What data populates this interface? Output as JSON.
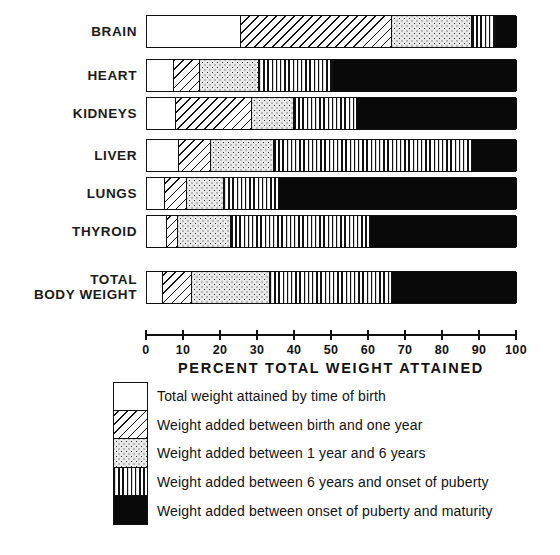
{
  "chart_data": {
    "type": "bar",
    "subtype": "stacked-horizontal-100pct",
    "title": "",
    "xlabel": "PERCENT TOTAL WEIGHT ATTAINED",
    "ylabel": "",
    "xlim": [
      0,
      100
    ],
    "grid": false,
    "legend_position": "bottom",
    "categories": [
      "BRAIN",
      "HEART",
      "KIDNEYS",
      "LIVER",
      "LUNGS",
      "THYROID",
      "TOTAL BODY WEIGHT"
    ],
    "series": [
      {
        "name": "Total weight attained by time of birth",
        "pattern": "white",
        "values": [
          25,
          7,
          7.5,
          8.5,
          4.5,
          5,
          4
        ]
      },
      {
        "name": "Weight added between birth and one year",
        "pattern": "diagonal-hatch",
        "values": [
          41,
          7,
          20.5,
          8.5,
          6,
          3,
          8
        ]
      },
      {
        "name": "Weight added between 1 year and 6 years",
        "pattern": "dots",
        "values": [
          21.5,
          16,
          11.5,
          17,
          10,
          14.5,
          21
        ]
      },
      {
        "name": "Weight added between 6 years and onset of puberty",
        "pattern": "vertical-lines",
        "values": [
          6.5,
          20,
          17,
          53.5,
          15,
          37.5,
          33
        ]
      },
      {
        "name": "Weight added between onset of puberty and maturity",
        "pattern": "solid-black",
        "values": [
          6,
          50,
          43.5,
          12.5,
          64.5,
          40,
          34
        ]
      }
    ],
    "cumulative_boundaries": {
      "BRAIN": [
        25,
        66,
        87.5,
        94,
        100
      ],
      "HEART": [
        7,
        14,
        30,
        50,
        100
      ],
      "KIDNEYS": [
        7.5,
        28,
        39.5,
        56.5,
        100
      ],
      "LIVER": [
        8.5,
        17,
        34,
        87.5,
        100
      ],
      "LUNGS": [
        4.5,
        10.5,
        20.5,
        35.5,
        100
      ],
      "THYROID": [
        5,
        8,
        22.5,
        60,
        100
      ],
      "TOTAL BODY WEIGHT": [
        4,
        12,
        33,
        66,
        100
      ]
    },
    "xticks": [
      0,
      10,
      20,
      30,
      40,
      50,
      60,
      70,
      80,
      90,
      100
    ],
    "xticklabels": [
      "0",
      "10",
      "20",
      "30",
      "40",
      "50",
      "60",
      "70",
      "80",
      "90",
      "100"
    ]
  },
  "rows": [
    {
      "label": "BRAIN",
      "label_lines": [
        "BRAIN"
      ]
    },
    {
      "label": "HEART",
      "label_lines": [
        "HEART"
      ]
    },
    {
      "label": "KIDNEYS",
      "label_lines": [
        "KIDNEYS"
      ]
    },
    {
      "label": "LIVER",
      "label_lines": [
        "LIVER"
      ]
    },
    {
      "label": "LUNGS",
      "label_lines": [
        "LUNGS"
      ]
    },
    {
      "label": "THYROID",
      "label_lines": [
        "THYROID"
      ]
    },
    {
      "label": "TOTAL BODY WEIGHT",
      "label_lines": [
        "TOTAL",
        "BODY WEIGHT"
      ]
    }
  ],
  "axis": {
    "title": "PERCENT TOTAL WEIGHT ATTAINED",
    "min": 0,
    "max": 100
  },
  "legend": {
    "items": [
      {
        "pattern": "white",
        "text": "Total weight attained by time of birth"
      },
      {
        "pattern": "diagonal-hatch",
        "text": "Weight added between birth and one year"
      },
      {
        "pattern": "dots",
        "text": "Weight added between 1 year and 6 years"
      },
      {
        "pattern": "vertical-lines",
        "text": "Weight added between 6 years and onset of puberty"
      },
      {
        "pattern": "solid-black",
        "text": "Weight added between onset of puberty and maturity"
      }
    ]
  },
  "colors": {
    "ink": "#111111",
    "paper": "#ffffff",
    "black_fill": "#090909",
    "dot_fill": "#e9e9e9"
  }
}
